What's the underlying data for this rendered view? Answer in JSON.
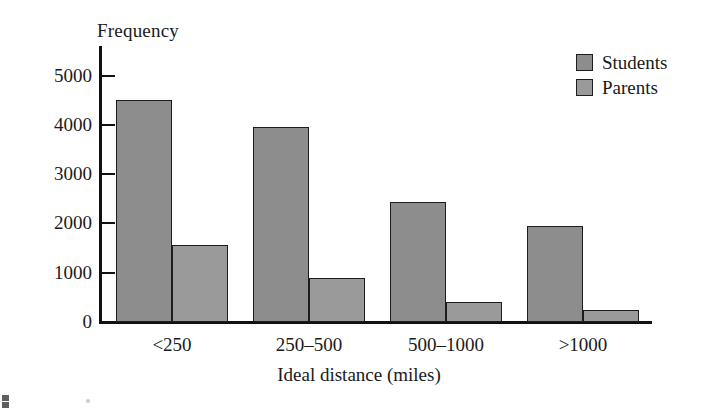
{
  "chart_data": {
    "type": "bar",
    "title": "",
    "xlabel": "Ideal distance (miles)",
    "ylabel": "Frequency",
    "categories": [
      "<250",
      "250–500",
      "500–1000",
      ">1000"
    ],
    "series": [
      {
        "name": "Students",
        "color": "#8d8d8d",
        "values": [
          4500,
          3950,
          2430,
          1950
        ]
      },
      {
        "name": "Parents",
        "color": "#9a9a9a",
        "values": [
          1560,
          900,
          400,
          240
        ]
      }
    ],
    "ylim": [
      0,
      5600
    ],
    "yticks": [
      0,
      1000,
      2000,
      3000,
      4000,
      5000
    ],
    "ytick_labels": [
      "0",
      "1000",
      "2000",
      "3000",
      "4000",
      "5000"
    ],
    "grid": false,
    "legend_position": "top-right"
  },
  "axes": {
    "y_title": "Frequency",
    "x_title": "Ideal distance (miles)"
  },
  "legend": {
    "entries": [
      {
        "label": "Students",
        "color": "#8d8d8d"
      },
      {
        "label": "Parents",
        "color": "#9a9a9a"
      }
    ]
  }
}
